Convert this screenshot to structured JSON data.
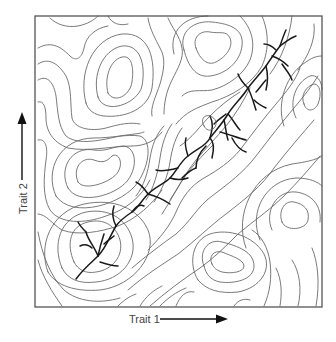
{
  "diagram": {
    "type": "fitness-landscape-contour-map",
    "x_axis": {
      "label": "Trait 1",
      "arrow_direction": "right"
    },
    "y_axis": {
      "label": "Trait 2",
      "arrow_direction": "up"
    },
    "colors": {
      "frame": "#555555",
      "contour": "#6b6b6b",
      "lineage": "#1a1a1a",
      "axis": "#111111",
      "label": "#444444",
      "background": "#ffffff"
    },
    "elements": [
      "contour-lines",
      "branching-lineage-tree along diagonal ridge"
    ]
  }
}
